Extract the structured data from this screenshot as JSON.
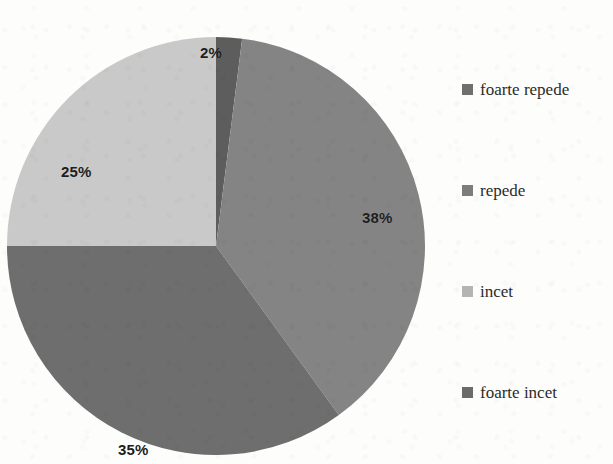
{
  "chart_data": {
    "type": "pie",
    "title": "",
    "categories": [
      "foarte repede",
      "repede",
      "incet",
      "foarte incet"
    ],
    "values": [
      2,
      38,
      35,
      25
    ],
    "value_labels": [
      "2%",
      "38%",
      "35%",
      "25%"
    ],
    "unit": "%",
    "legend_position": "right",
    "grid": false,
    "start_angle_deg": 0,
    "direction": "clockwise",
    "colors": [
      "#5d5d5d",
      "#848484",
      "#6e6e6e",
      "#c9c9c9"
    ],
    "slices": [
      {
        "label": "foarte repede",
        "value": 2,
        "value_label": "2%",
        "color": "#5d5d5d"
      },
      {
        "label": "repede",
        "value": 38,
        "value_label": "38%",
        "color": "#848484"
      },
      {
        "label": "incet",
        "value": 35,
        "value_label": "35%",
        "color": "#6e6e6e"
      },
      {
        "label": "foarte incet",
        "value": 25,
        "value_label": "25%",
        "color": "#c9c9c9"
      }
    ]
  },
  "legend": {
    "items": [
      {
        "label": "foarte repede",
        "swatch_color": "#6f6f6f",
        "swatch_icon": "square-swatch-icon"
      },
      {
        "label": "repede",
        "swatch_color": "#7d7d7d",
        "swatch_icon": "square-swatch-icon"
      },
      {
        "label": "incet",
        "swatch_color": "#b4b4b4",
        "swatch_icon": "square-swatch-icon"
      },
      {
        "label": "foarte incet",
        "swatch_color": "#6b6b6b",
        "swatch_icon": "square-swatch-icon"
      }
    ]
  },
  "colors": {
    "background": "#fdfdfc",
    "label_text": "#1d1d1d",
    "legend_text": "#2b2b2b"
  }
}
